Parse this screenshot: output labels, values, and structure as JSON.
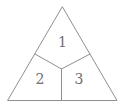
{
  "figure": {
    "regions": [
      {
        "label": "1"
      },
      {
        "label": "2"
      },
      {
        "label": "3"
      }
    ],
    "colors": {
      "background": "#ffffff",
      "line": "#8f8f8f",
      "label": "#707070"
    }
  }
}
